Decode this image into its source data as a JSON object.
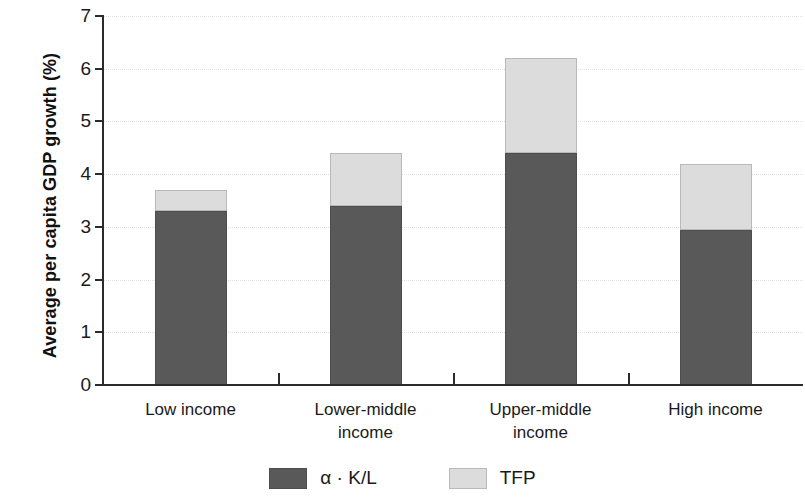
{
  "chart_data": {
    "type": "bar",
    "subtype": "stacked-bar",
    "title": "",
    "xlabel": "",
    "ylabel": "Average per capita GDP growth (%)",
    "ylim": [
      0,
      7
    ],
    "yticks": [
      0,
      1,
      2,
      3,
      4,
      5,
      6,
      7
    ],
    "ytick_labels": [
      "0",
      "1",
      "2",
      "3",
      "4",
      "5",
      "6",
      "7"
    ],
    "grid": true,
    "grid_axis": "y",
    "legend_position": "bottom",
    "categories": [
      "Low income",
      "Lower-middle income",
      "Upper-middle income",
      "High income"
    ],
    "category_label_lines": [
      [
        "Low income"
      ],
      [
        "Lower-middle",
        "income"
      ],
      [
        "Upper-middle",
        "income"
      ],
      [
        "High income"
      ]
    ],
    "series": [
      {
        "name": "α · K/L",
        "color": "#595959",
        "values": [
          3.3,
          3.4,
          4.4,
          2.95
        ]
      },
      {
        "name": "TFP",
        "color": "#dcdcdc",
        "values": [
          0.4,
          1.0,
          1.8,
          1.25
        ]
      }
    ],
    "totals": [
      3.7,
      4.4,
      6.2,
      4.2
    ]
  },
  "legend": {
    "items": [
      {
        "label": "α · K/L",
        "swatch": "dark"
      },
      {
        "label": "TFP",
        "swatch": "light"
      }
    ]
  },
  "axis": {
    "y_title": "Average per capita GDP growth (%)"
  }
}
